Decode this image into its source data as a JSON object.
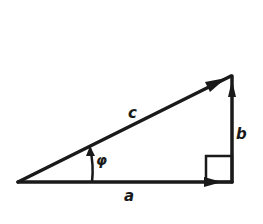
{
  "diagram": {
    "type": "right-triangle-vector",
    "stroke_color": "#1a1a1a",
    "background": "#ffffff",
    "labels": {
      "hypotenuse": "c",
      "base": "a",
      "height": "b",
      "angle": "φ"
    },
    "vertices": {
      "origin": [
        18,
        182
      ],
      "right_angle": [
        232,
        182
      ],
      "apex": [
        232,
        75
      ]
    }
  }
}
